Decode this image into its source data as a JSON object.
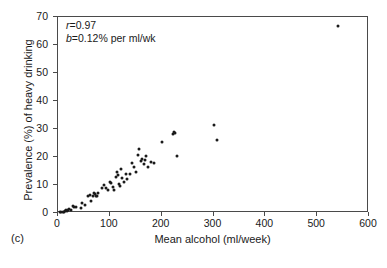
{
  "figure": {
    "panel_label": "(c)"
  },
  "annotation": {
    "correlation_symbol": "r",
    "correlation_text": "=0.97",
    "slope_symbol": "b",
    "slope_text": "=0.12% per ml/wk"
  },
  "chart_data": {
    "type": "scatter",
    "title": "",
    "xlabel": "Mean alcohol (ml/week)",
    "ylabel": "Prevalence (%) of heavy drinking",
    "xlim": [
      0,
      600
    ],
    "ylim": [
      0,
      70
    ],
    "xticks": [
      0,
      100,
      200,
      300,
      400,
      500,
      600
    ],
    "yticks": [
      0,
      10,
      20,
      30,
      40,
      50,
      60,
      70
    ],
    "grid": false,
    "legend": null,
    "annotations": [
      "r=0.97",
      "b=0.12% per ml/wk"
    ],
    "series": [
      {
        "name": "Populations",
        "marker": "filled-circle",
        "color": "#1a1a1a",
        "points": [
          [
            3,
            0.2
          ],
          [
            6,
            0.3
          ],
          [
            9,
            0.4
          ],
          [
            12,
            0.5
          ],
          [
            14,
            0.6
          ],
          [
            16,
            0.9
          ],
          [
            18,
            0.7
          ],
          [
            20,
            1.0
          ],
          [
            22,
            1.4
          ],
          [
            25,
            1.1
          ],
          [
            28,
            2.6
          ],
          [
            31,
            2.1
          ],
          [
            34,
            2.0
          ],
          [
            44,
            1.9
          ],
          [
            47,
            3.5
          ],
          [
            52,
            2.8
          ],
          [
            57,
            6.0
          ],
          [
            61,
            6.3
          ],
          [
            64,
            4.2
          ],
          [
            68,
            6.1
          ],
          [
            70,
            7.0
          ],
          [
            72,
            6.9
          ],
          [
            74,
            6.2
          ],
          [
            76,
            6.0
          ],
          [
            78,
            7.1
          ],
          [
            84,
            8.9
          ],
          [
            88,
            9.9
          ],
          [
            92,
            8.8
          ],
          [
            96,
            8.3
          ],
          [
            100,
            11.0
          ],
          [
            103,
            10.6
          ],
          [
            106,
            9.2
          ],
          [
            109,
            8.1
          ],
          [
            111,
            12.9
          ],
          [
            113,
            14.5
          ],
          [
            115,
            13.6
          ],
          [
            117,
            10.3
          ],
          [
            119,
            9.6
          ],
          [
            122,
            15.8
          ],
          [
            124,
            12.4
          ],
          [
            127,
            11.1
          ],
          [
            131,
            13.9
          ],
          [
            134,
            12.2
          ],
          [
            138,
            14.0
          ],
          [
            142,
            17.7
          ],
          [
            146,
            16.3
          ],
          [
            150,
            14.6
          ],
          [
            154,
            20.7
          ],
          [
            157,
            22.7
          ],
          [
            160,
            18.4
          ],
          [
            163,
            19.4
          ],
          [
            165,
            17.6
          ],
          [
            168,
            19.1
          ],
          [
            170,
            20.4
          ],
          [
            173,
            16.4
          ],
          [
            180,
            18.1
          ],
          [
            186,
            17.9
          ],
          [
            201,
            25.2
          ],
          [
            221,
            28.3
          ],
          [
            224,
            29.0
          ],
          [
            225,
            28.5
          ],
          [
            229,
            20.3
          ],
          [
            300,
            31.6
          ],
          [
            307,
            26.1
          ],
          [
            540,
            66.8
          ]
        ]
      }
    ]
  }
}
